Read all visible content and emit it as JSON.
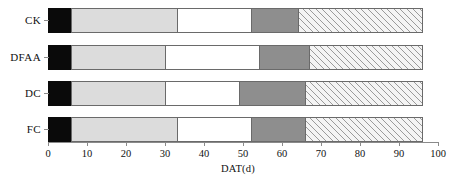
{
  "chart_data": {
    "type": "bar",
    "orientation": "horizontal",
    "stacked": true,
    "title": "",
    "xlabel": "DAT(d)",
    "ylabel": "",
    "xlim": [
      0,
      100
    ],
    "xticks": [
      0,
      10,
      20,
      30,
      40,
      50,
      60,
      70,
      80,
      90,
      100
    ],
    "xtick_labels": [
      "0",
      "10",
      "20",
      "30",
      "40",
      "50",
      "60",
      "70",
      "80",
      "90",
      "100"
    ],
    "grid": false,
    "legend": "none",
    "categories": [
      "CK",
      "DFAA",
      "DC",
      "FC"
    ],
    "series": [
      {
        "name": "stage-1",
        "fill": "black",
        "values": [
          6,
          6,
          6,
          6
        ]
      },
      {
        "name": "stage-2",
        "fill": "light-gray",
        "values": [
          27,
          24,
          24,
          27
        ]
      },
      {
        "name": "stage-3",
        "fill": "white",
        "values": [
          19,
          24,
          19,
          19
        ]
      },
      {
        "name": "stage-4",
        "fill": "dark-gray",
        "values": [
          12,
          13,
          17,
          14
        ]
      },
      {
        "name": "stage-5",
        "fill": "hatched",
        "values": [
          32,
          29,
          30,
          30
        ]
      }
    ],
    "cumulative_boundaries": {
      "CK": [
        0,
        6,
        33,
        52,
        64,
        96
      ],
      "DFAA": [
        0,
        6,
        30,
        54,
        67,
        96
      ],
      "DC": [
        0,
        6,
        30,
        49,
        66,
        96
      ],
      "FC": [
        0,
        6,
        33,
        52,
        66,
        96
      ]
    },
    "colors": {
      "black": "#0a0a0a",
      "light-gray": "#dcdcdc",
      "white": "#ffffff",
      "dark-gray": "#8e8e8e",
      "hatched": "#f4f4f4",
      "outline": "#6a6a6a",
      "axis": "#8a8a8a"
    }
  }
}
